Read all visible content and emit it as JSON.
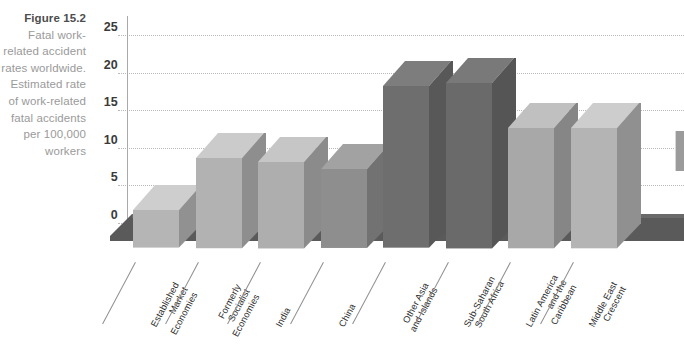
{
  "figure": {
    "number_label": "Figure 15.2",
    "number_prefix": "Figure",
    "number": "15.2",
    "caption_text": "Fatal work-related accident rates worldwide. Estimated rate of work-related fatal accidents per 100,000 workers"
  },
  "edge_tab": {
    "name": "page-edge-tab"
  },
  "chart_data": {
    "type": "bar",
    "title": "Fatal work-related accident rates worldwide",
    "xlabel": "",
    "ylabel": "Estimated rate of work-related fatal accidents per 100,000 workers",
    "ylim": [
      0,
      25
    ],
    "yticks": [
      0,
      5,
      10,
      15,
      20,
      25
    ],
    "ytick_labels": [
      "0",
      "5",
      "10",
      "15",
      "20",
      "25"
    ],
    "grid": true,
    "legend": "none",
    "three_d": true,
    "categories": [
      "Established\nMarket\nEconomies",
      "Formerly\nSocialist\nEconomies",
      "India",
      "China",
      "Other Asia\nand Islands",
      "Sub-Saharan\nSouth Africa",
      "Latin America\nand the\nCaribbean",
      "Middle East\nCrescent"
    ],
    "values": [
      5.0,
      12.0,
      11.5,
      10.5,
      21.5,
      22.0,
      16.0,
      16.0
    ],
    "bar_colors": [
      "#b5b5b5",
      "#b2b2b2",
      "#aeaeae",
      "#8e8e8e",
      "#6e6e6e",
      "#6a6a6a",
      "#a8a8a8",
      "#b4b4b4"
    ]
  }
}
